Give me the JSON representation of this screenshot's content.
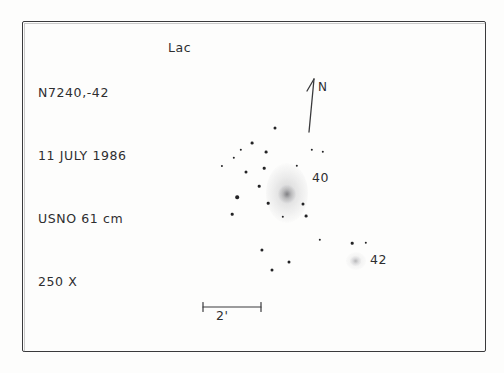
{
  "sketch": {
    "medium": "hand-drawn observing log sketch",
    "header": {
      "object_designation": "N7240,-42",
      "date": "11 JULY 1986",
      "instrument": "USNO 61 cm",
      "magnification": "250 X",
      "constellation": "Lac"
    },
    "orientation": {
      "north_label": "N",
      "arrow_name": "north-arrow"
    },
    "scale": {
      "label": "2'",
      "bar_length_px": 58
    },
    "objects": [
      {
        "name": "galaxy-ngc7240",
        "label": "40",
        "type": "galaxy",
        "cx": 287,
        "cy": 193,
        "width": 42,
        "height": 60,
        "label_x": 312,
        "label_y": 170
      },
      {
        "name": "galaxy-ngc7242",
        "label": "42",
        "type": "galaxy",
        "cx": 356,
        "cy": 261,
        "width": 20,
        "height": 18,
        "label_x": 370,
        "label_y": 252
      }
    ],
    "stars": [
      {
        "x": 275,
        "y": 128,
        "r": 1.5
      },
      {
        "x": 252,
        "y": 143,
        "r": 1.4
      },
      {
        "x": 241,
        "y": 150,
        "r": 1.2
      },
      {
        "x": 266,
        "y": 152,
        "r": 1.4
      },
      {
        "x": 234,
        "y": 158,
        "r": 1.2
      },
      {
        "x": 312,
        "y": 150,
        "r": 1.2
      },
      {
        "x": 323,
        "y": 152,
        "r": 1.2
      },
      {
        "x": 222,
        "y": 166,
        "r": 1.1
      },
      {
        "x": 246,
        "y": 172,
        "r": 1.5
      },
      {
        "x": 264,
        "y": 168,
        "r": 1.3
      },
      {
        "x": 297,
        "y": 166,
        "r": 1.2
      },
      {
        "x": 259,
        "y": 186,
        "r": 1.3
      },
      {
        "x": 237,
        "y": 197,
        "r": 1.8
      },
      {
        "x": 268,
        "y": 203,
        "r": 1.3
      },
      {
        "x": 303,
        "y": 204,
        "r": 1.5
      },
      {
        "x": 306,
        "y": 216,
        "r": 1.4
      },
      {
        "x": 283,
        "y": 217,
        "r": 1.2
      },
      {
        "x": 232,
        "y": 214,
        "r": 1.3
      },
      {
        "x": 320,
        "y": 240,
        "r": 1.2
      },
      {
        "x": 352,
        "y": 243,
        "r": 1.3
      },
      {
        "x": 366,
        "y": 243,
        "r": 1.2
      },
      {
        "x": 262,
        "y": 250,
        "r": 1.6
      },
      {
        "x": 289,
        "y": 262,
        "r": 1.5
      },
      {
        "x": 272,
        "y": 270,
        "r": 1.5
      }
    ]
  }
}
